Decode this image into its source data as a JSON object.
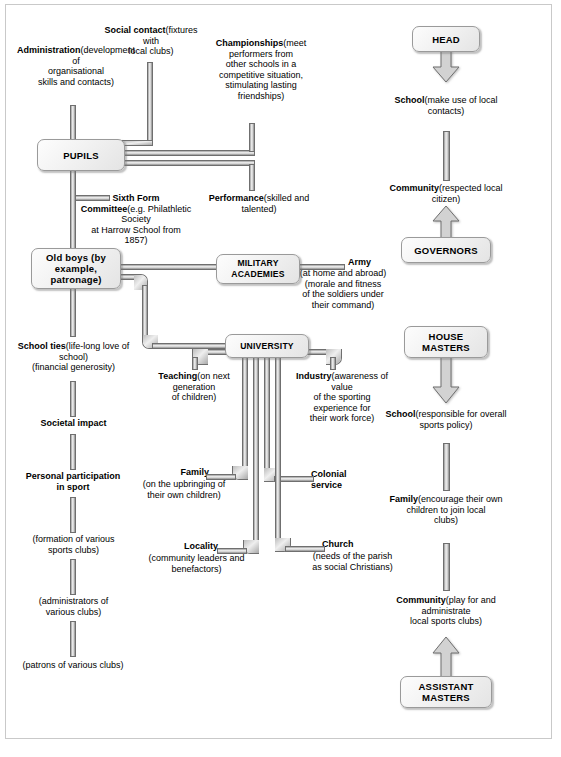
{
  "diagram": {
    "colors": {
      "box_border": "#9a9a9a",
      "box_fill": "#f0f0f0",
      "pipe_light": "#efefef",
      "pipe_dark": "#8a8a8a",
      "frame": "#c9c9c9",
      "text": "#000000"
    },
    "boxes": [
      {
        "id": "pupils",
        "label": "PUPILS"
      },
      {
        "id": "oldboys",
        "label": "Old boys\n(by example,\npatronage)"
      },
      {
        "id": "military",
        "label": "MILITARY\nACADEMIES"
      },
      {
        "id": "university",
        "label": "UNIVERSITY"
      },
      {
        "id": "head",
        "label": "HEAD"
      },
      {
        "id": "governors",
        "label": "GOVERNORS"
      },
      {
        "id": "house",
        "label": "HOUSE\nMASTERS"
      },
      {
        "id": "assistant",
        "label": "ASSISTANT\nMASTERS"
      }
    ],
    "left_column": {
      "administration": {
        "title": "Administration",
        "detail": "(development of\norganisational\nskills and contacts)"
      },
      "social_contact": {
        "title": "Social contact",
        "detail": "(fixtures with\nlocal clubs)"
      },
      "championships": {
        "title": "Championships",
        "detail": "(meet performers from\nother schools in a\ncompetitive situation,\nstimulating lasting\nfriendships)"
      },
      "sixth_form": {
        "title": "Sixth Form\nCommittee",
        "detail": "(e.g. Philathletic Society\nat Harrow School from\n1857)"
      },
      "performance": {
        "title": "Performance",
        "detail": "(skilled and talented)"
      },
      "army": {
        "title": "Army",
        "detail": "(at home and abroad)\n(morale and fitness\nof the soldiers under\ntheir command)"
      },
      "school_ties": {
        "title": "School ties",
        "detail": "(life-long love of school)\n(financial generosity)"
      },
      "societal_impact": {
        "title": "Societal impact",
        "detail": ""
      },
      "personal_participation": {
        "title": "Personal participation\nin sport",
        "detail": ""
      },
      "formation": {
        "title": "",
        "detail": "(formation of various\nsports clubs)"
      },
      "administrators": {
        "title": "",
        "detail": "(administrators of\nvarious clubs)"
      },
      "patrons": {
        "title": "",
        "detail": "(patrons of various clubs)"
      }
    },
    "university_branches": {
      "teaching": {
        "title": "Teaching",
        "detail": "(on next\ngeneration\nof children)"
      },
      "industry": {
        "title": "Industry",
        "detail": "(awareness of value\nof the sporting\nexperience for\ntheir work force)"
      },
      "family": {
        "title": "Family",
        "detail": "(on the upbringing of\ntheir own children)"
      },
      "colonial": {
        "title": "Colonial\nservice",
        "detail": ""
      },
      "locality": {
        "title": "Locality",
        "detail": "(community leaders and\nbenefactors)"
      },
      "church": {
        "title": "Church",
        "detail": "(needs of the parish\nas social Christians)"
      }
    },
    "right_column": {
      "head_school": {
        "title": "School",
        "detail": "(make use of local\ncontacts)"
      },
      "head_community": {
        "title": "Community",
        "detail": "(respected local citizen)"
      },
      "house_school": {
        "title": "School",
        "detail": "(responsible for overall\nsports policy)"
      },
      "house_family": {
        "title": "Family",
        "detail": "(encourage their own\nchildren to join local\nclubs)"
      },
      "house_community": {
        "title": "Community",
        "detail": "(play for and\nadministrate\nlocal sports clubs)"
      }
    }
  }
}
